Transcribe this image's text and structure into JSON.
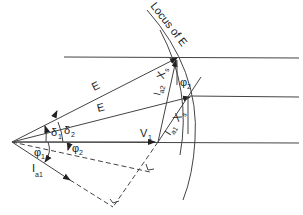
{
  "diagram": {
    "type": "phasor-diagram",
    "labels": {
      "locus": "Locus of E",
      "e_upper": "E",
      "e_lower": "E",
      "v1": "V",
      "v1_sub": "1",
      "ia2_xs": "I",
      "ia2_sub": "a2",
      "xs_upper": "X",
      "xs_upper_sub": "s",
      "ia1_xs": "I",
      "ia1_sub": "a1",
      "xs_lower": "X",
      "xs_lower_sub": "s",
      "ia1_arrow": "I",
      "ia1_arrow_sub": "a1",
      "delta1": "δ",
      "delta1_sub": "1",
      "delta2": "δ",
      "delta2_sub": "2",
      "phi1": "φ",
      "phi1_sub": "1",
      "phi2_left": "φ",
      "phi2_left_sub": "2",
      "phi2_right": "φ",
      "phi2_right_sub": "2"
    },
    "colors": {
      "stroke": "#444444",
      "text": "#222222",
      "background": "#ffffff"
    }
  }
}
